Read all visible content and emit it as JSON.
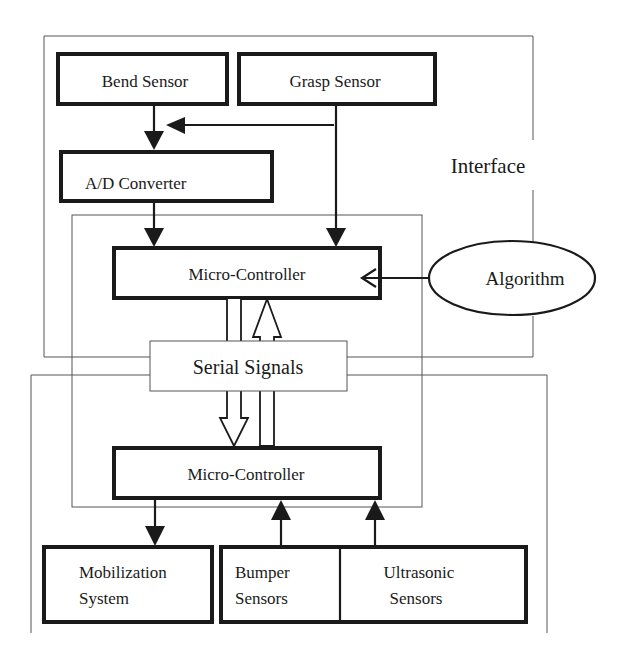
{
  "diagram": {
    "regions": {
      "interface": {
        "label": "Interface"
      },
      "robot": {
        "label": ""
      }
    },
    "nodes": {
      "bend_sensor": "Bend Sensor",
      "grasp_sensor": "Grasp Sensor",
      "ad_converter": "A/D Converter",
      "micro_controller_top": "Micro-Controller",
      "algorithm": "Algorithm",
      "serial_signals": "Serial Signals",
      "micro_controller_bottom": "Micro-Controller",
      "mobilization_system": [
        "Mobilization",
        "System"
      ],
      "bumper_sensors": [
        "Bumper",
        "Sensors"
      ],
      "ultrasonic_sensors": [
        "Ultrasonic",
        "Sensors"
      ]
    },
    "edges": [
      {
        "from": "Bend Sensor",
        "to": "A/D Converter",
        "style": "solid-arrow"
      },
      {
        "from": "Grasp Sensor",
        "to": "A/D Converter",
        "style": "solid-arrow"
      },
      {
        "from": "A/D Converter",
        "to": "Micro-Controller (top)",
        "style": "solid-arrow"
      },
      {
        "from": "Grasp Sensor",
        "to": "Micro-Controller (top)",
        "style": "solid-arrow"
      },
      {
        "from": "Algorithm",
        "to": "Micro-Controller (top)",
        "style": "open-arrow"
      },
      {
        "from": "Micro-Controller (top)",
        "to": "Micro-Controller (bottom)",
        "style": "hollow-block-arrow",
        "via": "Serial Signals"
      },
      {
        "from": "Micro-Controller (bottom)",
        "to": "Micro-Controller (top)",
        "style": "hollow-block-arrow",
        "via": "Serial Signals"
      },
      {
        "from": "Micro-Controller (bottom)",
        "to": "Mobilization System",
        "style": "solid-arrow"
      },
      {
        "from": "Bumper Sensors",
        "to": "Micro-Controller (bottom)",
        "style": "solid-arrow"
      },
      {
        "from": "Ultrasonic Sensors",
        "to": "Micro-Controller (bottom)",
        "style": "solid-arrow"
      }
    ]
  }
}
